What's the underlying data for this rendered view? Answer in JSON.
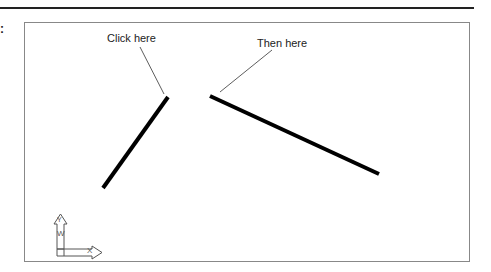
{
  "figure": {
    "prefix_glyph": ":",
    "labels": {
      "first": "Click here",
      "second": "Then here"
    },
    "ucs_icon": {
      "y_axis": "Y",
      "x_axis": "X",
      "world": "W"
    },
    "lines": [
      {
        "name": "first-line",
        "x1": 168,
        "y1": 97,
        "x2": 103,
        "y2": 188
      },
      {
        "name": "second-line",
        "x1": 210,
        "y1": 96,
        "x2": 379,
        "y2": 174
      }
    ],
    "leaders": [
      {
        "name": "first-leader",
        "x1": 140,
        "y1": 47,
        "x2": 164,
        "y2": 94
      },
      {
        "name": "second-leader",
        "x1": 272,
        "y1": 50,
        "x2": 220,
        "y2": 92
      }
    ],
    "colors": {
      "line": "#000000",
      "frame": "#888888"
    }
  }
}
